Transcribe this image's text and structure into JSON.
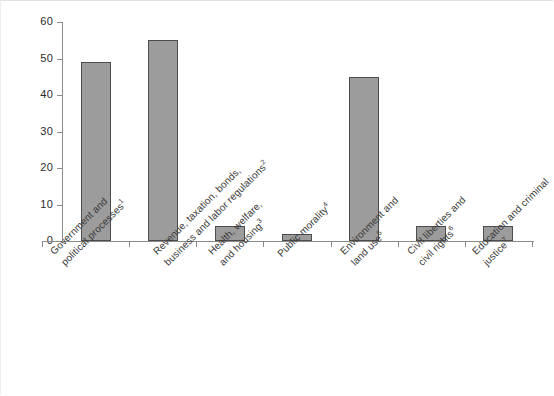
{
  "chart_data": {
    "type": "bar",
    "title": "",
    "subtitle": "",
    "xlabel": "",
    "ylabel": "",
    "ylim": [
      0,
      60
    ],
    "yticks": [
      "0",
      "10",
      "20",
      "30",
      "40",
      "50",
      "60"
    ],
    "grid": false,
    "legend": false,
    "orientation": "vertical",
    "bar_color": "#9c9c9c",
    "bar_border_color": "#4d4d4d",
    "axis_color": "#8a8a8a",
    "categories": [
      "Government and political processes¹",
      "Revenue, taxation, bonds, business and labor regulations²",
      "Health, welfare, and housing³",
      "Public morality⁴",
      "Environment and land use⁵",
      "Civil liberties and civil rights⁶",
      "Education and criminal justice⁷"
    ],
    "values": [
      49,
      55,
      4,
      2,
      45,
      4,
      4
    ],
    "category_labels": [
      {
        "line1": "Government and",
        "line2": "political processes",
        "footnote": "1"
      },
      {
        "line1": "Revenue, taxation, bonds,",
        "line2": "business and labor regulations",
        "footnote": "2"
      },
      {
        "line1": "Health, welfare,",
        "line2": "and housing",
        "footnote": "3"
      },
      {
        "line1": "Public morality",
        "line2": "",
        "footnote": "4"
      },
      {
        "line1": "Environment and",
        "line2": "land use",
        "footnote": "5"
      },
      {
        "line1": "Civil liberties and",
        "line2": "civil rights",
        "footnote": "6"
      },
      {
        "line1": "Education and criminal",
        "line2": "justice",
        "footnote": "7"
      }
    ]
  }
}
